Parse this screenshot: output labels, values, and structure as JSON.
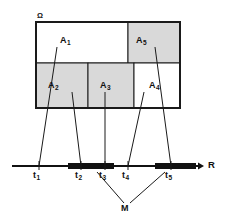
{
  "figure": {
    "universe_label": "Ω",
    "axis_label": "R",
    "set_label": "M",
    "colors": {
      "shaded": "#d9d9d9",
      "unshaded": "#ffffff",
      "stroke": "#1a1a1a",
      "thick_segment": "#111111",
      "background": "#ffffff"
    },
    "regions": [
      {
        "name": "A",
        "index": "1",
        "shaded": false,
        "x": 36,
        "y": 22,
        "w": 92,
        "h": 41,
        "label_x": 62,
        "label_y": 42
      },
      {
        "name": "A",
        "index": "2",
        "shaded": true,
        "x": 36,
        "y": 63,
        "w": 52,
        "h": 45,
        "label_x": 50,
        "label_y": 84
      },
      {
        "name": "A",
        "index": "3",
        "shaded": true,
        "x": 88,
        "y": 63,
        "w": 46,
        "h": 45,
        "label_x": 102,
        "label_y": 84
      },
      {
        "name": "A",
        "index": "4",
        "shaded": false,
        "x": 134,
        "y": 63,
        "w": 46,
        "h": 45,
        "label_x": 151,
        "label_y": 84
      },
      {
        "name": "A",
        "index": "5",
        "shaded": true,
        "x": 128,
        "y": 22,
        "w": 52,
        "h": 41,
        "label_x": 138,
        "label_y": 42
      }
    ],
    "ticks": [
      {
        "name": "t",
        "index": "1",
        "x": 39,
        "label_x": 34,
        "label_y": 172
      },
      {
        "name": "t",
        "index": "2",
        "x": 81,
        "label_x": 76,
        "label_y": 172
      },
      {
        "name": "t",
        "index": "3",
        "x": 105,
        "label_x": 100,
        "label_y": 172
      },
      {
        "name": "t",
        "index": "4",
        "x": 128,
        "label_x": 123,
        "label_y": 172
      },
      {
        "name": "t",
        "index": "5",
        "x": 171,
        "label_x": 166,
        "label_y": 172
      }
    ],
    "axis": {
      "y": 166,
      "x_start": 12,
      "x_end": 196,
      "arrow_x": 202,
      "label_x": 205,
      "label_y": 160
    },
    "thick_segments": [
      {
        "x1": 68,
        "x2": 114
      },
      {
        "x1": 155,
        "x2": 196
      }
    ],
    "connectors": [
      {
        "from": "A1",
        "x1": 57,
        "y1": 47,
        "x2": 39,
        "y2": 166
      },
      {
        "from": "A2",
        "x1": 72,
        "y1": 92,
        "x2": 81,
        "y2": 166
      },
      {
        "from": "A3",
        "x1": 105,
        "y1": 92,
        "x2": 105,
        "y2": 166
      },
      {
        "from": "A4",
        "x1": 144,
        "y1": 92,
        "x2": 128,
        "y2": 166
      },
      {
        "from": "A5",
        "x1": 155,
        "y1": 47,
        "x2": 171,
        "y2": 166
      }
    ],
    "m_pointers": [
      {
        "x1": 97,
        "y1": 172,
        "x2": 124,
        "y2": 205
      },
      {
        "x1": 165,
        "y1": 172,
        "x2": 130,
        "y2": 205
      }
    ],
    "m_label": {
      "x": 121,
      "y": 206
    }
  }
}
